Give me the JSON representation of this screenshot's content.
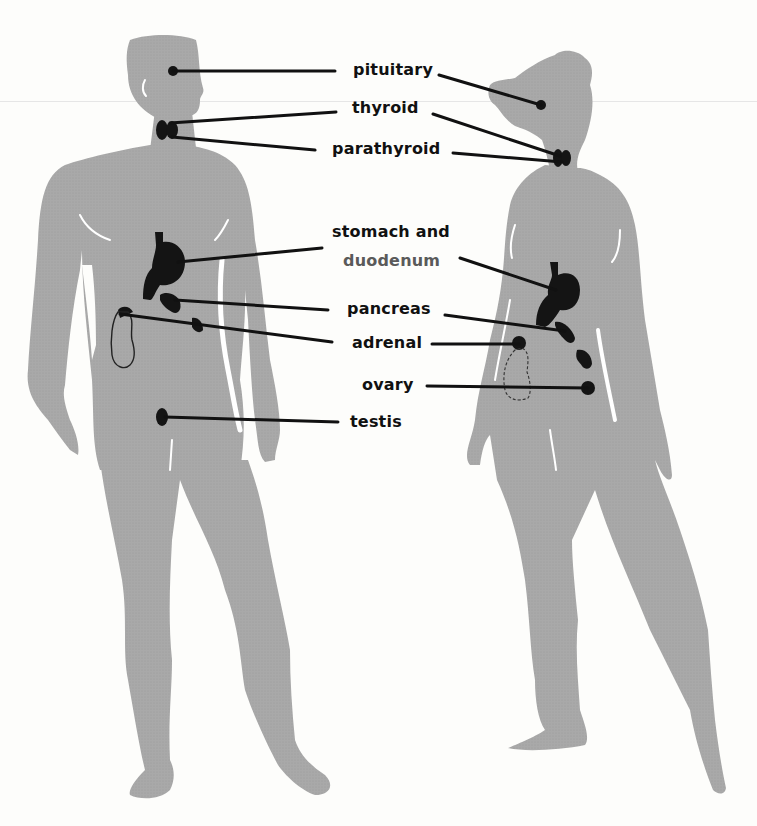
{
  "diagram": {
    "title": "",
    "type": "anatomical-endocrine-glands",
    "figures": [
      {
        "id": "male",
        "description": "male silhouette, front view, head turned right"
      },
      {
        "id": "female",
        "description": "female silhouette, three-quarter view facing left"
      }
    ],
    "colors": {
      "background": "#fdfdfb",
      "silhouette": "#a9a9a9",
      "organ": "#141414",
      "leader_line": "#111111",
      "label_text": "#111111",
      "label_faded": "#5a5a5a",
      "highlight": "#ffffff"
    },
    "labels": [
      {
        "id": "pituitary",
        "text": "pituitary",
        "targets": [
          "male-head",
          "female-head"
        ]
      },
      {
        "id": "thyroid",
        "text": "thyroid",
        "targets": [
          "male-neck",
          "female-neck"
        ]
      },
      {
        "id": "parathyroid",
        "text": "parathyroid",
        "targets": [
          "male-neck",
          "female-neck"
        ]
      },
      {
        "id": "stomach_line1",
        "text": "stomach and",
        "targets": [
          "male-stomach",
          "female-stomach"
        ]
      },
      {
        "id": "stomach_line2",
        "text": "duodenum",
        "targets": []
      },
      {
        "id": "pancreas",
        "text": "pancreas",
        "targets": [
          "male-pancreas",
          "female-pancreas"
        ]
      },
      {
        "id": "adrenal",
        "text": "adrenal",
        "targets": [
          "male-adrenal",
          "female-adrenal"
        ]
      },
      {
        "id": "ovary",
        "text": "ovary",
        "targets": [
          "female-ovary"
        ]
      },
      {
        "id": "testis",
        "text": "testis",
        "targets": [
          "male-testis"
        ]
      }
    ]
  },
  "labels": {
    "pituitary": "pituitary",
    "thyroid": "thyroid",
    "parathyroid": "parathyroid",
    "stomach": "stomach and",
    "duodenum": "duodenum",
    "pancreas": "pancreas",
    "adrenal": "adrenal",
    "ovary": "ovary",
    "testis": "testis"
  }
}
